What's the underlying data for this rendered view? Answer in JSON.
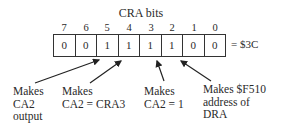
{
  "title": "CRA bits",
  "bit_numbers": [
    "7",
    "6",
    "5",
    "4",
    "3",
    "2",
    "1",
    "0"
  ],
  "bit_values": [
    "0",
    "0",
    "1",
    "1",
    "1",
    "1",
    "0",
    "0"
  ],
  "hex_value": "= $3C",
  "annotations": [
    {
      "text": "Makes\nCA2\noutput",
      "target_bit": "5"
    },
    {
      "text": "Makes\nCA2 = CRA3",
      "target_bit": "4"
    },
    {
      "text": "Makes\nCA2 = 1",
      "target_bit": "3"
    },
    {
      "text": "Makes $F510\naddress of\nDRA",
      "target_bit": "2"
    }
  ]
}
